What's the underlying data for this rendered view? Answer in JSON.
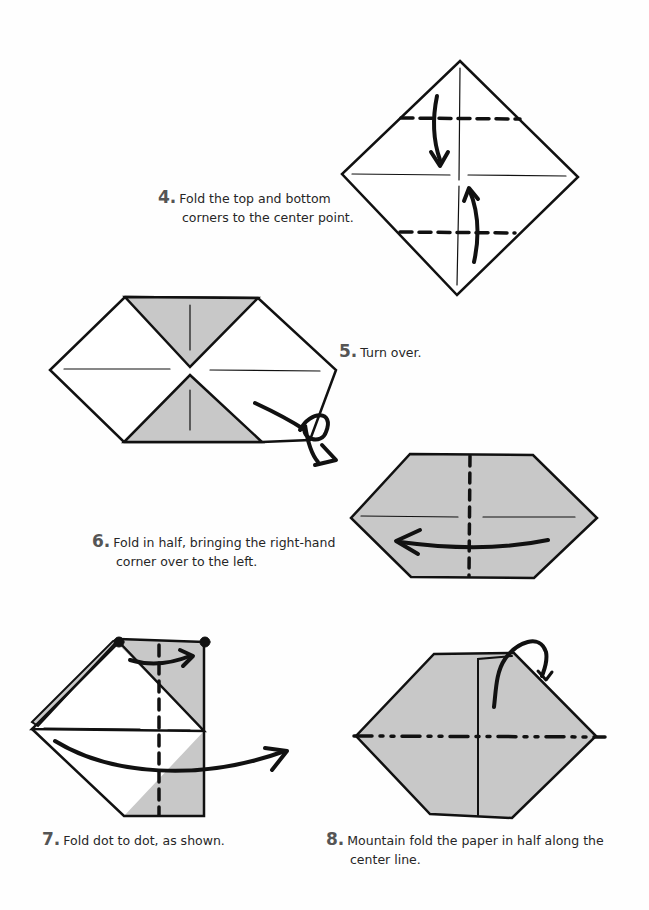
{
  "page": {
    "background": "#ffffff",
    "paper_fill": "#c8c8c8",
    "line_color": "#111111"
  },
  "steps": [
    {
      "number": "4.",
      "text_line1": "Fold the top and bottom",
      "text_line2": "corners to the center point.",
      "diagram": "square diamond with top and bottom valley folds and arrows to center"
    },
    {
      "number": "5.",
      "text_line1": "Turn over.",
      "text_line2": "",
      "diagram": "hexagon with shaded top and bottom triangles and turn-over arrow"
    },
    {
      "number": "6.",
      "text_line1": "Fold in half, bringing the right-hand",
      "text_line2": "corner over to the left.",
      "diagram": "shaded hexagon with vertical valley fold and left arrow"
    },
    {
      "number": "7.",
      "text_line1": "Fold dot to dot, as shown.",
      "text_line2": "",
      "diagram": "folded shape with dots and arrows"
    },
    {
      "number": "8.",
      "text_line1": "Mountain fold the paper in half along the",
      "text_line2": "center line.",
      "diagram": "hexagon with mountain fold line and arrow"
    }
  ]
}
